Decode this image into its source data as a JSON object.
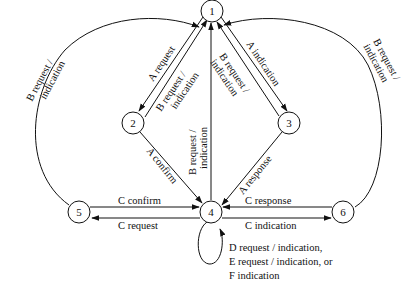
{
  "diagram": {
    "nodes": [
      {
        "id": "1",
        "label": "1"
      },
      {
        "id": "2",
        "label": "2"
      },
      {
        "id": "3",
        "label": "3"
      },
      {
        "id": "4",
        "label": "4"
      },
      {
        "id": "5",
        "label": "5"
      },
      {
        "id": "6",
        "label": "6"
      }
    ],
    "edges": {
      "e1_2": {
        "from": "1",
        "to": "2",
        "label": "A  request"
      },
      "e2_1": {
        "from": "2",
        "to": "1",
        "label1": "B  request /",
        "label2": "indication"
      },
      "e1_3": {
        "from": "1",
        "to": "3",
        "label": "A  indication"
      },
      "e3_1": {
        "from": "3",
        "to": "1",
        "label1": "B  request /",
        "label2": "indication"
      },
      "e4_1": {
        "from": "4",
        "to": "1",
        "label1": "B  request /",
        "label2": "indication"
      },
      "e2_4": {
        "from": "2",
        "to": "4",
        "label": "A  confirm"
      },
      "e3_4": {
        "from": "3",
        "to": "4",
        "label": "A  response"
      },
      "e5_1": {
        "from": "5",
        "to": "1",
        "label1": "B  request /",
        "label2": "indication"
      },
      "e6_1": {
        "from": "6",
        "to": "1",
        "label1": "B  request /",
        "label2": "indication"
      },
      "e5_4": {
        "from": "5",
        "to": "4",
        "label": "C  confirm"
      },
      "e4_5": {
        "from": "4",
        "to": "5",
        "label": "C request"
      },
      "e6_4": {
        "from": "6",
        "to": "4",
        "label": "C  response"
      },
      "e4_6": {
        "from": "4",
        "to": "6",
        "label": "C  indication"
      },
      "e4_4": {
        "from": "4",
        "to": "4",
        "lines": [
          "D  request / indication,",
          "E   request / indication,  or",
          "F   indication"
        ]
      }
    }
  }
}
